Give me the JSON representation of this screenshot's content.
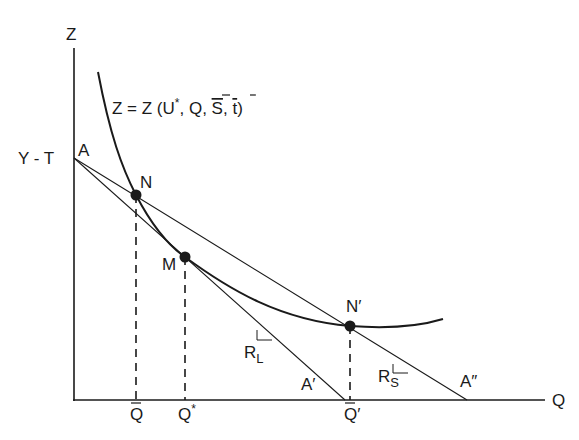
{
  "diagram": {
    "axes": {
      "y_label": "Z",
      "x_label": "Q",
      "intercept_label": "Y - T"
    },
    "curve_label": {
      "prefix": "Z = Z (U",
      "star": "*",
      "args": ", Q, ",
      "s": "S",
      "sep": ", ",
      "t": "t",
      "close": ")"
    },
    "points": {
      "A": "A",
      "N": "N",
      "M": "M",
      "N_prime": "N′",
      "A_prime": "A′",
      "A_double_prime": "A″"
    },
    "x_ticks": {
      "q_bar": "Q",
      "q_star": "Q",
      "q_star_sup": "*",
      "q_bar_prime": "Q",
      "q_bar_prime_suffix": "′"
    },
    "slope_labels": {
      "r_l_main": "R",
      "r_l_sub": "L",
      "r_s_main": "R",
      "r_s_sub": "S"
    },
    "colors": {
      "ink": "#1a1a1a",
      "background": "#ffffff"
    }
  }
}
